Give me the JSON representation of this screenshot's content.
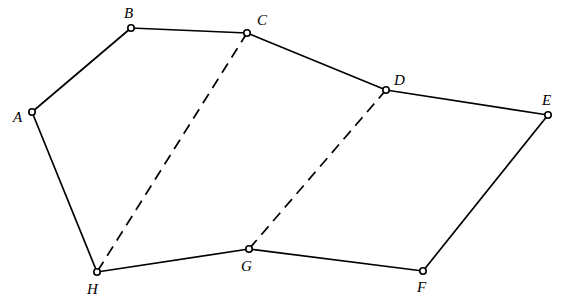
{
  "figure": {
    "background_color": "#ffffff",
    "stroke_color": "#000000",
    "width": 569,
    "height": 303
  },
  "vertices": [
    {
      "id": "A",
      "label": "A",
      "x": 32,
      "y": 112,
      "label_x": 13,
      "label_y": 122
    },
    {
      "id": "B",
      "label": "B",
      "x": 131,
      "y": 28,
      "label_x": 124,
      "label_y": 18
    },
    {
      "id": "C",
      "label": "C",
      "x": 247,
      "y": 33,
      "label_x": 257,
      "label_y": 25
    },
    {
      "id": "D",
      "label": "D",
      "x": 386,
      "y": 90,
      "label_x": 394,
      "label_y": 85
    },
    {
      "id": "E",
      "label": "E",
      "x": 548,
      "y": 115,
      "label_x": 542,
      "label_y": 105
    },
    {
      "id": "F",
      "label": "F",
      "x": 423,
      "y": 271,
      "label_x": 417,
      "label_y": 292
    },
    {
      "id": "G",
      "label": "G",
      "x": 249,
      "y": 249,
      "label_x": 241,
      "label_y": 271
    },
    {
      "id": "H",
      "label": "H",
      "x": 97,
      "y": 272,
      "label_x": 87,
      "label_y": 294
    }
  ],
  "marker": {
    "style": "open-circle",
    "radius": 3.2,
    "fill": "#ffffff",
    "stroke": "#000000"
  },
  "edges": [
    {
      "id": "AB",
      "from": "A",
      "to": "B",
      "style": "solid"
    },
    {
      "id": "BC",
      "from": "B",
      "to": "C",
      "style": "solid"
    },
    {
      "id": "CD",
      "from": "C",
      "to": "D",
      "style": "solid"
    },
    {
      "id": "DE",
      "from": "D",
      "to": "E",
      "style": "solid"
    },
    {
      "id": "EF",
      "from": "E",
      "to": "F",
      "style": "solid"
    },
    {
      "id": "FG",
      "from": "F",
      "to": "G",
      "style": "solid"
    },
    {
      "id": "GH",
      "from": "G",
      "to": "H",
      "style": "solid"
    },
    {
      "id": "HA",
      "from": "H",
      "to": "A",
      "style": "solid"
    },
    {
      "id": "CH",
      "from": "C",
      "to": "H",
      "style": "dashed"
    },
    {
      "id": "DG",
      "from": "D",
      "to": "G",
      "style": "dashed"
    }
  ]
}
